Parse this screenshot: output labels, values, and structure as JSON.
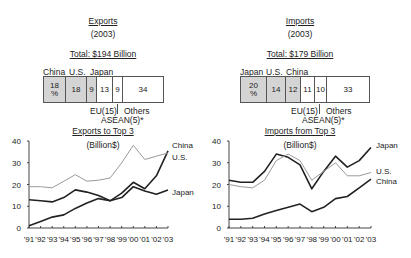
{
  "exports": {
    "title": "Exports",
    "year": "(2003)",
    "total": "Total: $194 Billion",
    "bar_top_labels": [
      "China",
      "U.S.",
      "Japan"
    ],
    "segments": [
      {
        "label": "China",
        "value": "18",
        "unit": "%",
        "shaded": true
      },
      {
        "label": "U.S.",
        "value": "18",
        "shaded": true
      },
      {
        "label": "Japan",
        "value": "9",
        "shaded": true
      },
      {
        "label": "EU(15)",
        "value": "13",
        "shaded": false
      },
      {
        "label": "ASEAN(5)*",
        "value": "9",
        "shaded": false
      },
      {
        "label": "Others",
        "value": "34",
        "shaded": false
      }
    ],
    "below_labels": {
      "eu": "EU(15)",
      "others": "Others",
      "asean": "ASEAN(5)*"
    },
    "chart_title": "Exports to Top 3",
    "chart_unit": "(Billion$)"
  },
  "imports": {
    "title": "Imports",
    "year": "(2003)",
    "total": "Total: $179 Billion",
    "bar_top_labels": [
      "Japan",
      "U.S.",
      "China"
    ],
    "segments": [
      {
        "label": "Japan",
        "value": "20",
        "unit": "%",
        "shaded": true
      },
      {
        "label": "U.S.",
        "value": "14",
        "shaded": true
      },
      {
        "label": "China",
        "value": "12",
        "shaded": true
      },
      {
        "label": "EU(15)",
        "value": "11",
        "shaded": false
      },
      {
        "label": "ASEAN(5)*",
        "value": "10",
        "shaded": false
      },
      {
        "label": "Others",
        "value": "33",
        "shaded": false
      }
    ],
    "below_labels": {
      "eu": "EU(15)",
      "others": "Others",
      "asean": "ASEAN(5)*"
    },
    "chart_title": "Imports from Top 3",
    "chart_unit": "(Billion$)"
  },
  "chart_data": [
    {
      "type": "bar",
      "title": "Exports (2003) Total: $194 Billion",
      "stacked": true,
      "unit": "%",
      "categories": [
        "China",
        "U.S.",
        "Japan",
        "EU(15)",
        "ASEAN(5)*",
        "Others"
      ],
      "values": [
        18,
        18,
        9,
        13,
        9,
        34
      ]
    },
    {
      "type": "bar",
      "title": "Imports (2003) Total: $179 Billion",
      "stacked": true,
      "unit": "%",
      "categories": [
        "Japan",
        "U.S.",
        "China",
        "EU(15)",
        "ASEAN(5)*",
        "Others"
      ],
      "values": [
        20,
        14,
        12,
        11,
        10,
        33
      ]
    },
    {
      "type": "line",
      "title": "Exports to Top 3",
      "ylabel": "(Billion$)",
      "xlabel": "",
      "ylim": [
        0,
        40
      ],
      "yticks": [
        0,
        10,
        20,
        30,
        40
      ],
      "x": [
        "'91",
        "'92",
        "'93",
        "'94",
        "'95",
        "'96",
        "'97",
        "'98",
        "'99",
        "'00",
        "'01",
        "'02",
        "'03"
      ],
      "series": [
        {
          "name": "China",
          "color": "#222222",
          "values": [
            1,
            3,
            5,
            6,
            9,
            11.5,
            13.5,
            12.5,
            16,
            21,
            18,
            24,
            35.5
          ]
        },
        {
          "name": "U.S.",
          "color": "#9a9a9a",
          "values": [
            19,
            19,
            18.5,
            21.5,
            24.5,
            21.5,
            22,
            23,
            30,
            38,
            31.5,
            33,
            34.5
          ]
        },
        {
          "name": "Japan",
          "color": "#222222",
          "values": [
            13,
            12.5,
            12,
            14,
            17.5,
            16.5,
            15,
            12.5,
            14,
            19,
            17,
            15.5,
            17.5
          ]
        }
      ],
      "grid": false,
      "legend": "inline-right"
    },
    {
      "type": "line",
      "title": "Imports from Top 3",
      "ylabel": "(Billion$)",
      "xlabel": "",
      "ylim": [
        0,
        40
      ],
      "yticks": [
        0,
        10,
        20,
        30,
        40
      ],
      "x": [
        "'91",
        "'92",
        "'93",
        "'94",
        "'95",
        "'96",
        "'97",
        "'98",
        "'99",
        "'00",
        "'01",
        "'02",
        "'03"
      ],
      "series": [
        {
          "name": "Japan",
          "color": "#222222",
          "values": [
            22,
            21,
            21,
            26,
            34,
            32.5,
            29,
            18,
            26,
            33,
            28,
            31,
            37
          ]
        },
        {
          "name": "U.S.",
          "color": "#9a9a9a",
          "values": [
            20,
            19,
            18.5,
            22,
            31,
            34,
            31,
            22,
            26,
            30,
            24,
            24,
            25.5
          ]
        },
        {
          "name": "China",
          "color": "#222222",
          "values": [
            4,
            4,
            4.5,
            6.5,
            8,
            9.5,
            11,
            7.5,
            9.5,
            13.5,
            14.5,
            18.5,
            22.5
          ]
        }
      ],
      "grid": false,
      "legend": "inline-right"
    }
  ]
}
